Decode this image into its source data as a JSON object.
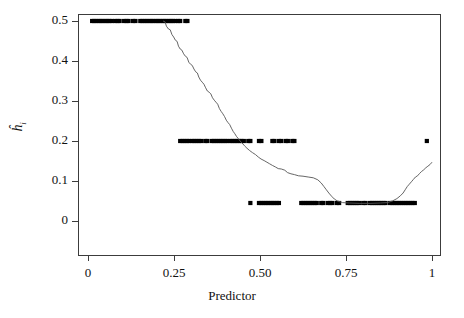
{
  "chart_data": {
    "type": "scatter",
    "title": "",
    "xlabel": "Predictor",
    "ylabel": "ĥi",
    "ylabel_base": "h",
    "ylabel_sub": "i",
    "xlim": [
      -0.03,
      1.03
    ],
    "ylim": [
      -0.02,
      0.52
    ],
    "xticks": [
      0,
      0.25,
      0.5,
      0.75,
      1
    ],
    "xticklabels": [
      "0",
      "0.25",
      "0.50",
      "0.75",
      "1"
    ],
    "yticks": [
      0,
      0.1,
      0.2,
      0.3,
      0.4,
      0.5
    ],
    "yticklabels": [
      "0",
      "0.1",
      "0.2",
      "0.3",
      "0.4",
      "0.5"
    ],
    "grid": false,
    "legend": false,
    "box": true,
    "point_color": "#000000",
    "line_color": "#555555",
    "point_marker": "square",
    "point_size": 4.2,
    "series": [
      {
        "name": "observed leverage values",
        "type": "scatter",
        "points": [
          [
            0.012,
            0.5
          ],
          [
            0.018,
            0.5
          ],
          [
            0.024,
            0.5
          ],
          [
            0.031,
            0.5
          ],
          [
            0.037,
            0.5
          ],
          [
            0.043,
            0.5
          ],
          [
            0.05,
            0.5
          ],
          [
            0.056,
            0.5
          ],
          [
            0.062,
            0.5
          ],
          [
            0.069,
            0.5
          ],
          [
            0.079,
            0.5
          ],
          [
            0.086,
            0.5
          ],
          [
            0.092,
            0.5
          ],
          [
            0.105,
            0.5
          ],
          [
            0.112,
            0.5
          ],
          [
            0.118,
            0.5
          ],
          [
            0.131,
            0.5
          ],
          [
            0.138,
            0.5
          ],
          [
            0.152,
            0.5
          ],
          [
            0.158,
            0.5
          ],
          [
            0.165,
            0.5
          ],
          [
            0.171,
            0.5
          ],
          [
            0.178,
            0.5
          ],
          [
            0.184,
            0.5
          ],
          [
            0.19,
            0.5
          ],
          [
            0.197,
            0.5
          ],
          [
            0.203,
            0.5
          ],
          [
            0.209,
            0.5
          ],
          [
            0.216,
            0.5
          ],
          [
            0.222,
            0.5
          ],
          [
            0.228,
            0.5
          ],
          [
            0.235,
            0.5
          ],
          [
            0.241,
            0.5
          ],
          [
            0.247,
            0.5
          ],
          [
            0.254,
            0.5
          ],
          [
            0.262,
            0.5
          ],
          [
            0.268,
            0.5
          ],
          [
            0.283,
            0.5
          ],
          [
            0.289,
            0.5
          ],
          [
            0.268,
            0.2
          ],
          [
            0.275,
            0.2
          ],
          [
            0.281,
            0.2
          ],
          [
            0.288,
            0.2
          ],
          [
            0.294,
            0.2
          ],
          [
            0.303,
            0.2
          ],
          [
            0.309,
            0.2
          ],
          [
            0.316,
            0.2
          ],
          [
            0.322,
            0.2
          ],
          [
            0.329,
            0.2
          ],
          [
            0.341,
            0.2
          ],
          [
            0.347,
            0.2
          ],
          [
            0.36,
            0.2
          ],
          [
            0.366,
            0.2
          ],
          [
            0.373,
            0.2
          ],
          [
            0.379,
            0.2
          ],
          [
            0.386,
            0.2
          ],
          [
            0.392,
            0.2
          ],
          [
            0.399,
            0.2
          ],
          [
            0.405,
            0.2
          ],
          [
            0.414,
            0.2
          ],
          [
            0.42,
            0.2
          ],
          [
            0.427,
            0.2
          ],
          [
            0.433,
            0.2
          ],
          [
            0.44,
            0.2
          ],
          [
            0.446,
            0.2
          ],
          [
            0.453,
            0.2
          ],
          [
            0.466,
            0.2
          ],
          [
            0.472,
            0.2
          ],
          [
            0.497,
            0.2
          ],
          [
            0.504,
            0.2
          ],
          [
            0.536,
            0.2
          ],
          [
            0.542,
            0.2
          ],
          [
            0.555,
            0.2
          ],
          [
            0.562,
            0.2
          ],
          [
            0.575,
            0.2
          ],
          [
            0.581,
            0.2
          ],
          [
            0.594,
            0.2
          ],
          [
            0.6,
            0.2
          ],
          [
            0.985,
            0.2
          ],
          [
            0.472,
            0.045
          ],
          [
            0.497,
            0.045
          ],
          [
            0.504,
            0.045
          ],
          [
            0.51,
            0.045
          ],
          [
            0.517,
            0.045
          ],
          [
            0.523,
            0.045
          ],
          [
            0.53,
            0.045
          ],
          [
            0.536,
            0.045
          ],
          [
            0.542,
            0.045
          ],
          [
            0.549,
            0.045
          ],
          [
            0.555,
            0.045
          ],
          [
            0.62,
            0.045
          ],
          [
            0.626,
            0.045
          ],
          [
            0.633,
            0.045
          ],
          [
            0.639,
            0.045
          ],
          [
            0.646,
            0.045
          ],
          [
            0.652,
            0.045
          ],
          [
            0.659,
            0.045
          ],
          [
            0.665,
            0.045
          ],
          [
            0.678,
            0.045
          ],
          [
            0.684,
            0.045
          ],
          [
            0.697,
            0.045
          ],
          [
            0.704,
            0.045
          ],
          [
            0.71,
            0.045
          ],
          [
            0.723,
            0.045
          ],
          [
            0.73,
            0.045
          ],
          [
            0.755,
            0.045
          ],
          [
            0.762,
            0.045
          ],
          [
            0.768,
            0.045
          ],
          [
            0.775,
            0.045
          ],
          [
            0.781,
            0.045
          ],
          [
            0.788,
            0.045
          ],
          [
            0.8,
            0.045
          ],
          [
            0.807,
            0.045
          ],
          [
            0.82,
            0.045
          ],
          [
            0.826,
            0.045
          ],
          [
            0.833,
            0.045
          ],
          [
            0.839,
            0.045
          ],
          [
            0.846,
            0.045
          ],
          [
            0.852,
            0.045
          ],
          [
            0.859,
            0.045
          ],
          [
            0.865,
            0.045
          ],
          [
            0.878,
            0.045
          ],
          [
            0.885,
            0.045
          ],
          [
            0.891,
            0.045
          ],
          [
            0.898,
            0.045
          ],
          [
            0.904,
            0.045
          ],
          [
            0.911,
            0.045
          ],
          [
            0.917,
            0.045
          ],
          [
            0.924,
            0.045
          ],
          [
            0.93,
            0.045
          ],
          [
            0.937,
            0.045
          ],
          [
            0.943,
            0.045
          ],
          [
            0.95,
            0.045
          ]
        ]
      },
      {
        "name": "fitted curve",
        "type": "line",
        "points": [
          [
            0.218,
            0.5
          ],
          [
            0.224,
            0.498
          ],
          [
            0.228,
            0.487
          ],
          [
            0.234,
            0.48
          ],
          [
            0.239,
            0.478
          ],
          [
            0.244,
            0.466
          ],
          [
            0.249,
            0.46
          ],
          [
            0.254,
            0.452
          ],
          [
            0.259,
            0.449
          ],
          [
            0.263,
            0.437
          ],
          [
            0.268,
            0.43
          ],
          [
            0.273,
            0.427
          ],
          [
            0.278,
            0.418
          ],
          [
            0.283,
            0.412
          ],
          [
            0.288,
            0.409
          ],
          [
            0.293,
            0.397
          ],
          [
            0.298,
            0.392
          ],
          [
            0.303,
            0.389
          ],
          [
            0.308,
            0.38
          ],
          [
            0.313,
            0.373
          ],
          [
            0.318,
            0.37
          ],
          [
            0.322,
            0.36
          ],
          [
            0.327,
            0.352
          ],
          [
            0.332,
            0.347
          ],
          [
            0.337,
            0.342
          ],
          [
            0.342,
            0.333
          ],
          [
            0.347,
            0.325
          ],
          [
            0.352,
            0.322
          ],
          [
            0.357,
            0.318
          ],
          [
            0.362,
            0.308
          ],
          [
            0.367,
            0.302
          ],
          [
            0.372,
            0.297
          ],
          [
            0.377,
            0.292
          ],
          [
            0.382,
            0.281
          ],
          [
            0.387,
            0.274
          ],
          [
            0.392,
            0.268
          ],
          [
            0.397,
            0.261
          ],
          [
            0.402,
            0.252
          ],
          [
            0.407,
            0.246
          ],
          [
            0.412,
            0.241
          ],
          [
            0.417,
            0.232
          ],
          [
            0.422,
            0.224
          ],
          [
            0.427,
            0.218
          ],
          [
            0.432,
            0.211
          ],
          [
            0.437,
            0.206
          ],
          [
            0.442,
            0.2
          ],
          [
            0.448,
            0.195
          ],
          [
            0.455,
            0.188
          ],
          [
            0.462,
            0.182
          ],
          [
            0.47,
            0.176
          ],
          [
            0.478,
            0.171
          ],
          [
            0.487,
            0.166
          ],
          [
            0.495,
            0.16
          ],
          [
            0.503,
            0.155
          ],
          [
            0.512,
            0.151
          ],
          [
            0.52,
            0.147
          ],
          [
            0.528,
            0.143
          ],
          [
            0.536,
            0.139
          ],
          [
            0.545,
            0.135
          ],
          [
            0.553,
            0.131
          ],
          [
            0.562,
            0.13
          ],
          [
            0.572,
            0.127
          ],
          [
            0.58,
            0.121
          ],
          [
            0.59,
            0.118
          ],
          [
            0.6,
            0.116
          ],
          [
            0.612,
            0.113
          ],
          [
            0.625,
            0.112
          ],
          [
            0.64,
            0.11
          ],
          [
            0.655,
            0.108
          ],
          [
            0.668,
            0.103
          ],
          [
            0.678,
            0.095
          ],
          [
            0.686,
            0.086
          ],
          [
            0.693,
            0.078
          ],
          [
            0.7,
            0.07
          ],
          [
            0.708,
            0.062
          ],
          [
            0.716,
            0.055
          ],
          [
            0.725,
            0.05
          ],
          [
            0.74,
            0.046
          ],
          [
            0.76,
            0.045
          ],
          [
            0.79,
            0.044
          ],
          [
            0.82,
            0.044
          ],
          [
            0.85,
            0.045
          ],
          [
            0.87,
            0.046
          ],
          [
            0.885,
            0.05
          ],
          [
            0.898,
            0.056
          ],
          [
            0.908,
            0.063
          ],
          [
            0.916,
            0.07
          ],
          [
            0.922,
            0.078
          ],
          [
            0.928,
            0.086
          ],
          [
            0.934,
            0.092
          ],
          [
            0.94,
            0.098
          ],
          [
            0.946,
            0.104
          ],
          [
            0.952,
            0.11
          ],
          [
            0.958,
            0.113
          ],
          [
            0.964,
            0.119
          ],
          [
            0.97,
            0.124
          ],
          [
            0.976,
            0.128
          ],
          [
            0.982,
            0.133
          ],
          [
            0.988,
            0.137
          ],
          [
            0.994,
            0.141
          ],
          [
            1.0,
            0.147
          ]
        ]
      }
    ]
  }
}
